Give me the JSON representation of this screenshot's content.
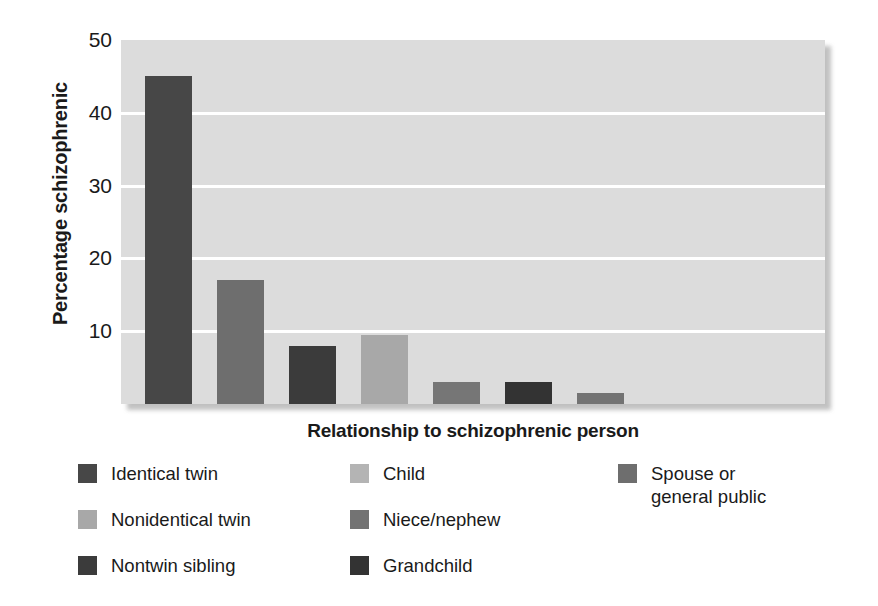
{
  "chart_data": {
    "type": "bar",
    "title": "",
    "xlabel": "Relationship to schizophrenic person",
    "ylabel": "Percentage schizophrenic",
    "categories": [
      "Identical twin",
      "Nonidentical twin",
      "Nontwin sibling",
      "Child",
      "Niece/nephew",
      "Grandchild",
      "Spouse or general public"
    ],
    "values": [
      45,
      17,
      8,
      9.5,
      3,
      3,
      1.5
    ],
    "ylim": [
      0,
      50
    ],
    "yticks": [
      10,
      20,
      30,
      40,
      50
    ],
    "ytick_labels": [
      "10",
      "20",
      "30",
      "40",
      "50"
    ],
    "xticks": [],
    "grid": "horizontal",
    "legend_position": "below",
    "plot_background": "#dcdcdc",
    "gridline_color": "#ffffff",
    "bar_colors": [
      "#474747",
      "#6e6e6e",
      "#3b3b3b",
      "#a8a8a8",
      "#767676",
      "#333333",
      "#737373"
    ]
  },
  "axes": {
    "y_title": "Percentage schizophrenic",
    "x_title": "Relationship to schizophrenic person",
    "y_tick_labels": [
      "50",
      "40",
      "30",
      "20",
      "10"
    ]
  },
  "legend": {
    "items": [
      {
        "label": "Identical twin",
        "color": "#474747",
        "column": 0,
        "row": 0
      },
      {
        "label": "Nonidentical twin",
        "color": "#a8a8a8",
        "column": 0,
        "row": 1
      },
      {
        "label": "Nontwin sibling",
        "color": "#3b3b3b",
        "column": 0,
        "row": 2
      },
      {
        "label": "Child",
        "color": "#b4b4b4",
        "column": 1,
        "row": 0
      },
      {
        "label": "Niece/nephew",
        "color": "#737373",
        "column": 1,
        "row": 1
      },
      {
        "label": "Grandchild",
        "color": "#333333",
        "column": 1,
        "row": 2
      },
      {
        "label": "Spouse or\ngeneral public",
        "color": "#6e6e6e",
        "column": 2,
        "row": 0
      }
    ]
  }
}
